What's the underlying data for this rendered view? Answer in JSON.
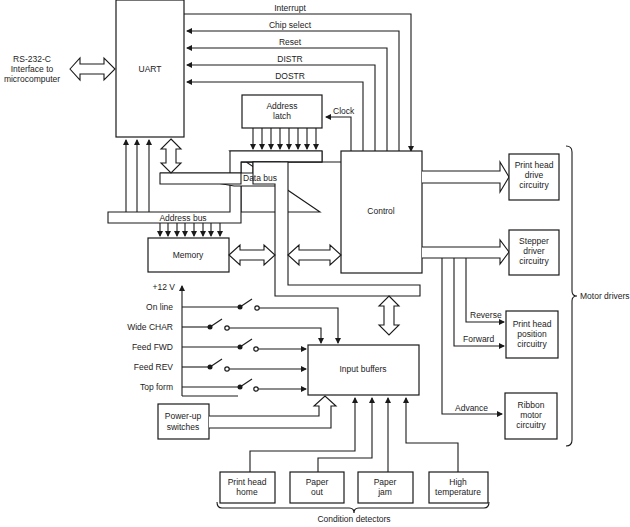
{
  "diagram": {
    "blocks": {
      "uart": "UART",
      "address_latch": [
        "Address",
        "latch"
      ],
      "control": "Control",
      "memory": "Memory",
      "input_buffers": "Input buffers",
      "power_up": [
        "Power-up",
        "switches"
      ],
      "print_head_drive": [
        "Print head",
        "drive",
        "circuitry"
      ],
      "stepper_driver": [
        "Stepper",
        "driver",
        "circuitry"
      ],
      "print_head_position": [
        "Print head",
        "position",
        "circuitry"
      ],
      "ribbon_motor": [
        "Ribbon",
        "motor",
        "circuitry"
      ],
      "print_head_home": [
        "Print head",
        "home"
      ],
      "paper_out": [
        "Paper",
        "out"
      ],
      "paper_jam": [
        "Paper",
        "jam"
      ],
      "high_temperature": [
        "High",
        "temperature"
      ]
    },
    "external": [
      "RS-232-C",
      "Interface to",
      "microcomputer"
    ],
    "signals": {
      "interrupt": "Interrupt",
      "chip_select": "Chip select",
      "reset": "Reset",
      "distr": "DISTR",
      "dostr": "DOSTR",
      "clock": "Clock",
      "reverse": "Reverse",
      "forward": "Forward",
      "advance": "Advance"
    },
    "buses": {
      "address_bus": "Address bus",
      "data_bus": "Data bus"
    },
    "switches": {
      "supply": "+12 V",
      "items": [
        "On line",
        "Wide CHAR",
        "Feed FWD",
        "Feed REV",
        "Top form"
      ]
    },
    "groups": {
      "motor_drivers": "Motor drivers",
      "condition_detectors": "Condition detectors"
    }
  }
}
